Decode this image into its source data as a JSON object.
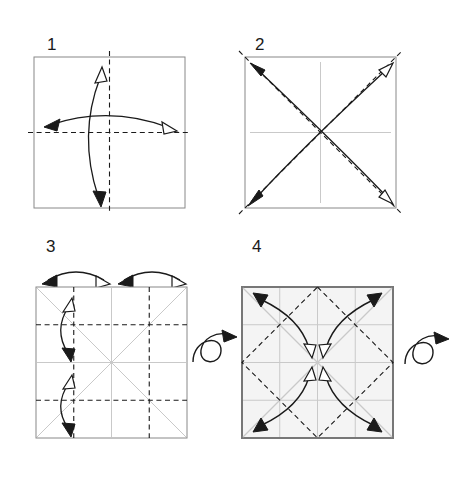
{
  "document": {
    "title": "Origami pre-creasing instructions",
    "type": "origami-fold-diagram",
    "width": 468,
    "height": 480,
    "background_color": "#ffffff"
  },
  "style": {
    "paper_edge_color": "#888888",
    "paper_edge_color_strong": "#777777",
    "paper_fill_plain": "#ffffff",
    "paper_fill_shaded": "#f4f4f4",
    "crease_existing_color": "#c9c9c9",
    "fold_line_color": "#1a1a1a",
    "arrow_color": "#1a1a1a",
    "arrowhead_filled_color": "#1a1a1a",
    "arrowhead_hollow_fill": "#ffffff",
    "label_color": "#1a1a1a"
  },
  "legend": {
    "dashed_line_meaning": "valley fold line",
    "gray_line_meaning": "existing crease",
    "filled_arrowhead_meaning": "fold direction",
    "hollow_arrowhead_meaning": "unfold / return direction",
    "loop_arrow_meaning": "turn the paper over"
  },
  "steps": [
    {
      "number": "1",
      "label_x": 47,
      "label_y": 50,
      "square": {
        "x": 34,
        "y": 57,
        "size": 151,
        "fill": "#ffffff",
        "stroke": "#888888",
        "stroke_width": 1
      },
      "fold_lines": [
        {
          "name": "vertical-center-fold",
          "type": "dashed",
          "orientation": "vertical",
          "position": "center"
        },
        {
          "name": "horizontal-center-fold",
          "type": "dashed",
          "orientation": "horizontal",
          "position": "center"
        }
      ],
      "existing_creases": [],
      "arrows": [
        {
          "name": "fold-in-half-horizontal-arrow",
          "shape": "arc",
          "filled_end": "left",
          "hollow_end": "right"
        },
        {
          "name": "fold-in-half-vertical-arrow",
          "shape": "arc",
          "filled_end": "bottom",
          "hollow_end": "top"
        }
      ],
      "turn_over": false,
      "instruction": "Fold the square in half vertically and horizontally, then unfold."
    },
    {
      "number": "2",
      "label_x": 255,
      "label_y": 50,
      "square": {
        "x": 245,
        "y": 57,
        "size": 151,
        "fill": "#ffffff",
        "stroke": "#888888",
        "stroke_width": 1
      },
      "fold_lines": [
        {
          "name": "diagonal-fold-tl-br",
          "type": "dashed",
          "orientation": "diagonal",
          "position": "tl-br"
        },
        {
          "name": "diagonal-fold-bl-tr",
          "type": "dashed",
          "orientation": "diagonal",
          "position": "bl-tr"
        }
      ],
      "existing_creases": [
        {
          "name": "crease-vertical-center",
          "orientation": "vertical",
          "position": "center"
        },
        {
          "name": "crease-horizontal-center",
          "orientation": "horizontal",
          "position": "center"
        }
      ],
      "arrows": [
        {
          "name": "fold-diagonal-bl-tr-arrow",
          "shape": "arc",
          "filled_end": "bottom-left",
          "hollow_end": "top-right"
        },
        {
          "name": "fold-diagonal-br-tl-arrow",
          "shape": "arc",
          "filled_end": "top-left",
          "hollow_end": "bottom-right"
        }
      ],
      "turn_over": false,
      "instruction": "Fold both diagonals, then unfold."
    },
    {
      "number": "3",
      "label_x": 46,
      "label_y": 252,
      "square": {
        "x": 36,
        "y": 287,
        "size": 151,
        "fill": "#ffffff",
        "stroke": "#888888",
        "stroke_width": 1
      },
      "fold_lines": [
        {
          "name": "quarter-fold-vertical-left",
          "type": "dashed",
          "orientation": "vertical",
          "position": "quarter"
        },
        {
          "name": "quarter-fold-vertical-right",
          "type": "dashed",
          "orientation": "vertical",
          "position": "three-quarter"
        },
        {
          "name": "quarter-fold-horizontal-top",
          "type": "dashed",
          "orientation": "horizontal",
          "position": "quarter"
        },
        {
          "name": "quarter-fold-horizontal-bottom",
          "type": "dashed",
          "orientation": "horizontal",
          "position": "three-quarter"
        }
      ],
      "existing_creases": [
        {
          "name": "crease-vertical-center",
          "orientation": "vertical",
          "position": "center"
        },
        {
          "name": "crease-horizontal-center",
          "orientation": "horizontal",
          "position": "center"
        },
        {
          "name": "crease-diagonal-tl-br",
          "orientation": "diagonal",
          "position": "tl-br"
        },
        {
          "name": "crease-diagonal-bl-tr",
          "orientation": "diagonal",
          "position": "bl-tr"
        }
      ],
      "arrows": [
        {
          "name": "top-edge-to-center-left-arrow",
          "shape": "arc",
          "filled_end": "left",
          "hollow_end": "right"
        },
        {
          "name": "top-edge-to-center-right-arrow",
          "shape": "arc",
          "filled_end": "left",
          "hollow_end": "right"
        },
        {
          "name": "left-edge-upper-fold-arrow",
          "shape": "arc",
          "filled_end": "bottom",
          "hollow_end": "top"
        },
        {
          "name": "left-edge-lower-fold-arrow",
          "shape": "arc",
          "filled_end": "bottom",
          "hollow_end": "top"
        }
      ],
      "turn_over": true,
      "turn_over_symbol": {
        "name": "turn-over-loop-arrow",
        "cx": 205,
        "cy": 348
      },
      "instruction": "Fold each edge to the center line to make quarter creases, unfold, then turn the paper over."
    },
    {
      "number": "4",
      "label_x": 252,
      "label_y": 252,
      "square": {
        "x": 242,
        "y": 287,
        "size": 151,
        "fill": "#f4f4f4",
        "stroke": "#777777",
        "stroke_width": 2
      },
      "fold_lines": [
        {
          "name": "diamond-fold-midpoints",
          "type": "dashed",
          "orientation": "diamond",
          "position": "edge-midpoints"
        }
      ],
      "existing_creases": [
        {
          "name": "crease-vertical-center",
          "orientation": "vertical",
          "position": "center"
        },
        {
          "name": "crease-horizontal-center",
          "orientation": "horizontal",
          "position": "center"
        },
        {
          "name": "crease-vertical-quarter",
          "orientation": "vertical",
          "position": "quarter"
        },
        {
          "name": "crease-vertical-three-quarter",
          "orientation": "vertical",
          "position": "three-quarter"
        },
        {
          "name": "crease-horizontal-quarter",
          "orientation": "horizontal",
          "position": "quarter"
        },
        {
          "name": "crease-horizontal-three-quarter",
          "orientation": "horizontal",
          "position": "three-quarter"
        },
        {
          "name": "crease-diagonal-tl-br",
          "orientation": "diagonal",
          "position": "tl-br"
        },
        {
          "name": "crease-diagonal-bl-tr",
          "orientation": "diagonal",
          "position": "bl-tr"
        }
      ],
      "arrows": [
        {
          "name": "corner-tl-to-center-arrow",
          "shape": "arc",
          "filled_end": "top-left",
          "hollow_end": "center"
        },
        {
          "name": "corner-tr-to-center-arrow",
          "shape": "arc",
          "filled_end": "top-right",
          "hollow_end": "center"
        },
        {
          "name": "corner-bl-to-center-arrow",
          "shape": "arc",
          "filled_end": "bottom-left",
          "hollow_end": "center"
        },
        {
          "name": "corner-br-to-center-arrow",
          "shape": "arc",
          "filled_end": "bottom-right",
          "hollow_end": "center"
        }
      ],
      "turn_over": true,
      "turn_over_symbol": {
        "name": "turn-over-loop-arrow",
        "cx": 425,
        "cy": 350
      },
      "instruction": "Fold all four corners to the center, unfold, then turn the paper over."
    }
  ]
}
